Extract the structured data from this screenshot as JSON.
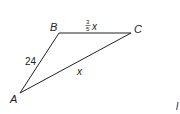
{
  "diagram": {
    "type": "triangle",
    "vertices": [
      {
        "name": "A",
        "label": "A"
      },
      {
        "name": "B",
        "label": "B"
      },
      {
        "name": "C",
        "label": "C"
      }
    ],
    "sides": {
      "AB": {
        "label": "24"
      },
      "BC": {
        "label_numerator": "3",
        "label_denominator": "5",
        "label_var": "x"
      },
      "AC": {
        "label": "x"
      }
    },
    "stray_label": "l"
  }
}
